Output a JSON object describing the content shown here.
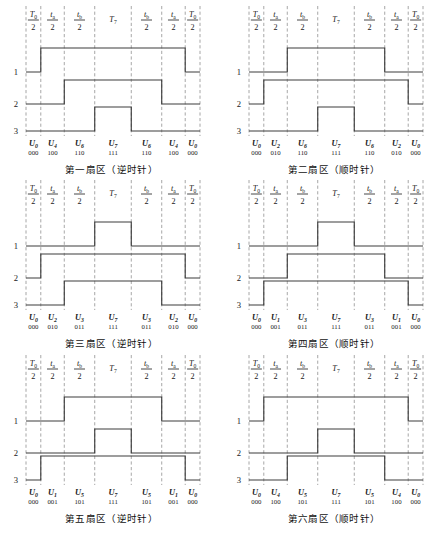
{
  "figure": {
    "channel_labels": [
      "1",
      "2",
      "3"
    ],
    "segment_count": 7,
    "segments": [
      {
        "num": "T",
        "num_sub": "0",
        "den": "2"
      },
      {
        "num": "t",
        "num_sub": "a",
        "den": "2"
      },
      {
        "num": "t",
        "num_sub": "b",
        "den": "2"
      },
      {
        "num": "T",
        "num_sub": "7",
        "den": ""
      },
      {
        "num": "t",
        "num_sub": "b",
        "den": "2"
      },
      {
        "num": "t",
        "num_sub": "a",
        "den": "2"
      },
      {
        "num": "T",
        "num_sub": "0",
        "den": "2"
      }
    ],
    "colors": {
      "wave": "#3c3c3c",
      "grid": "#8a8a8a",
      "text": "#1a1a1a",
      "background": "#ffffff"
    }
  },
  "panels": [
    {
      "id": "sector-1",
      "caption": "第一扇区（逆时针）",
      "vectors": [
        {
          "sym": "U",
          "sub": "0",
          "bits": "000"
        },
        {
          "sym": "U",
          "sub": "4",
          "bits": "100"
        },
        {
          "sym": "U",
          "sub": "6",
          "bits": "110"
        },
        {
          "sym": "U",
          "sub": "7",
          "bits": "111"
        },
        {
          "sym": "U",
          "sub": "6",
          "bits": "110"
        },
        {
          "sym": "U",
          "sub": "4",
          "bits": "100"
        },
        {
          "sym": "U",
          "sub": "0",
          "bits": "000"
        }
      ],
      "channel_states": [
        [
          0,
          1,
          1,
          1,
          1,
          1,
          0
        ],
        [
          0,
          0,
          1,
          1,
          1,
          0,
          0
        ],
        [
          0,
          0,
          0,
          1,
          0,
          0,
          0
        ]
      ]
    },
    {
      "id": "sector-2",
      "caption": "第二扇区（顺时针）",
      "vectors": [
        {
          "sym": "U",
          "sub": "0",
          "bits": "000"
        },
        {
          "sym": "U",
          "sub": "2",
          "bits": "010"
        },
        {
          "sym": "U",
          "sub": "6",
          "bits": "110"
        },
        {
          "sym": "U",
          "sub": "7",
          "bits": "111"
        },
        {
          "sym": "U",
          "sub": "6",
          "bits": "110"
        },
        {
          "sym": "U",
          "sub": "2",
          "bits": "010"
        },
        {
          "sym": "U",
          "sub": "0",
          "bits": "000"
        }
      ],
      "channel_states": [
        [
          0,
          0,
          1,
          1,
          1,
          0,
          0
        ],
        [
          0,
          1,
          1,
          1,
          1,
          1,
          0
        ],
        [
          0,
          0,
          0,
          1,
          0,
          0,
          0
        ]
      ]
    },
    {
      "id": "sector-3",
      "caption": "第三扇区（逆时针）",
      "vectors": [
        {
          "sym": "U",
          "sub": "0",
          "bits": "000"
        },
        {
          "sym": "U",
          "sub": "2",
          "bits": "010"
        },
        {
          "sym": "U",
          "sub": "3",
          "bits": "011"
        },
        {
          "sym": "U",
          "sub": "7",
          "bits": "111"
        },
        {
          "sym": "U",
          "sub": "3",
          "bits": "011"
        },
        {
          "sym": "U",
          "sub": "2",
          "bits": "010"
        },
        {
          "sym": "U",
          "sub": "0",
          "bits": "000"
        }
      ],
      "channel_states": [
        [
          0,
          0,
          0,
          1,
          0,
          0,
          0
        ],
        [
          0,
          1,
          1,
          1,
          1,
          1,
          0
        ],
        [
          0,
          0,
          1,
          1,
          1,
          0,
          0
        ]
      ]
    },
    {
      "id": "sector-4",
      "caption": "第四扇区（顺时针）",
      "vectors": [
        {
          "sym": "U",
          "sub": "0",
          "bits": "000"
        },
        {
          "sym": "U",
          "sub": "1",
          "bits": "001"
        },
        {
          "sym": "U",
          "sub": "3",
          "bits": "011"
        },
        {
          "sym": "U",
          "sub": "7",
          "bits": "111"
        },
        {
          "sym": "U",
          "sub": "3",
          "bits": "011"
        },
        {
          "sym": "U",
          "sub": "1",
          "bits": "001"
        },
        {
          "sym": "U",
          "sub": "0",
          "bits": "000"
        }
      ],
      "channel_states": [
        [
          0,
          0,
          0,
          1,
          0,
          0,
          0
        ],
        [
          0,
          0,
          1,
          1,
          1,
          0,
          0
        ],
        [
          0,
          1,
          1,
          1,
          1,
          1,
          0
        ]
      ]
    },
    {
      "id": "sector-5",
      "caption": "第五扇区（逆时针）",
      "vectors": [
        {
          "sym": "U",
          "sub": "0",
          "bits": "000"
        },
        {
          "sym": "U",
          "sub": "1",
          "bits": "001"
        },
        {
          "sym": "U",
          "sub": "5",
          "bits": "101"
        },
        {
          "sym": "U",
          "sub": "7",
          "bits": "111"
        },
        {
          "sym": "U",
          "sub": "5",
          "bits": "101"
        },
        {
          "sym": "U",
          "sub": "1",
          "bits": "001"
        },
        {
          "sym": "U",
          "sub": "0",
          "bits": "000"
        }
      ],
      "channel_states": [
        [
          0,
          0,
          1,
          1,
          1,
          0,
          0
        ],
        [
          0,
          0,
          0,
          1,
          0,
          0,
          0
        ],
        [
          0,
          1,
          1,
          1,
          1,
          1,
          0
        ]
      ]
    },
    {
      "id": "sector-6",
      "caption": "第六扇区（顺时针）",
      "vectors": [
        {
          "sym": "U",
          "sub": "0",
          "bits": "000"
        },
        {
          "sym": "U",
          "sub": "4",
          "bits": "100"
        },
        {
          "sym": "U",
          "sub": "5",
          "bits": "101"
        },
        {
          "sym": "U",
          "sub": "7",
          "bits": "111"
        },
        {
          "sym": "U",
          "sub": "5",
          "bits": "101"
        },
        {
          "sym": "U",
          "sub": "4",
          "bits": "100"
        },
        {
          "sym": "U",
          "sub": "0",
          "bits": "000"
        }
      ],
      "channel_states": [
        [
          0,
          1,
          1,
          1,
          1,
          1,
          0
        ],
        [
          0,
          0,
          0,
          1,
          0,
          0,
          0
        ],
        [
          0,
          0,
          1,
          1,
          1,
          0,
          0
        ]
      ]
    }
  ]
}
